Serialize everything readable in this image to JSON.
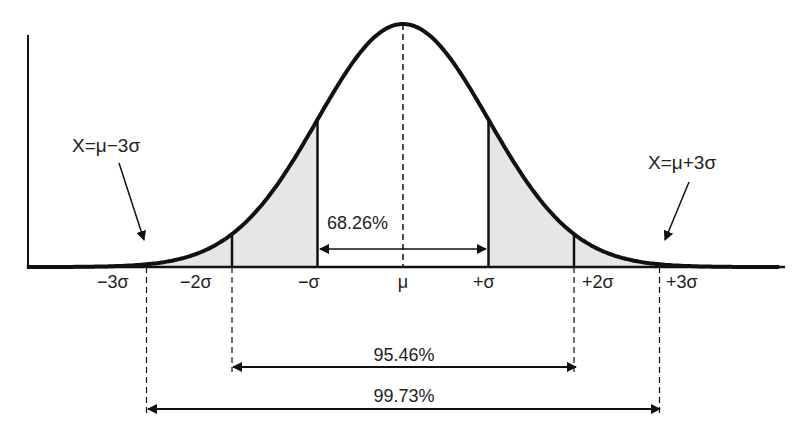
{
  "chart_data": {
    "type": "area",
    "title": "",
    "xlabel": "",
    "ylabel": "",
    "grid": false,
    "legend": null,
    "mean_label": "μ",
    "tick_labels": [
      "−3σ",
      "−2σ",
      "−σ",
      "μ",
      "+σ",
      "+2σ",
      "+3σ"
    ],
    "tick_positions_sigma": [
      -3,
      -2,
      -1,
      0,
      1,
      2,
      3
    ],
    "x_range_sigma": [
      -4.4,
      4.4
    ],
    "shaded_regions_sigma": [
      [
        -4.4,
        -1
      ],
      [
        1,
        4.4
      ]
    ],
    "intervals": [
      {
        "label": "68.26%",
        "from": -1,
        "to": 1,
        "value": 68.26
      },
      {
        "label": "95.46%",
        "from": -2,
        "to": 2,
        "value": 95.46
      },
      {
        "label": "99.73%",
        "from": -3,
        "to": 3,
        "value": 99.73
      }
    ],
    "annotations": [
      {
        "text": "X=μ−3σ",
        "points_to_sigma": -3
      },
      {
        "text": "X=μ+3σ",
        "points_to_sigma": 3
      }
    ]
  },
  "labels": {
    "ticks": {
      "m3": "−3σ",
      "m2": "−2σ",
      "m1": "−σ",
      "mu": "μ",
      "p1": "+σ",
      "p2": "+2σ",
      "p3": "+3σ"
    },
    "pct68": "68.26%",
    "pct95": "95.46%",
    "pct99": "99.73%",
    "annot_left": "X=μ−3σ",
    "annot_right": "X=μ+3σ"
  },
  "colors": {
    "line": "#111111",
    "fill": "#e6e6e6",
    "background": "#ffffff"
  }
}
